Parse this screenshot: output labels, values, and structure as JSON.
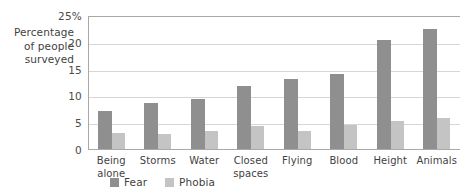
{
  "chart_data": {
    "type": "bar",
    "title": "",
    "xlabel": "",
    "ylabel": "Percentage of people surveyed",
    "ylabel_lines": [
      "Percentage",
      "of people",
      "surveyed"
    ],
    "categories": [
      "Being alone",
      "Storms",
      "Water",
      "Closed spaces",
      "Flying",
      "Blood",
      "Height",
      "Animals"
    ],
    "category_lines": [
      [
        "Being",
        "alone"
      ],
      [
        "Storms"
      ],
      [
        "Water"
      ],
      [
        "Closed",
        "spaces"
      ],
      [
        "Flying"
      ],
      [
        "Blood"
      ],
      [
        "Height"
      ],
      [
        "Animals"
      ]
    ],
    "series": [
      {
        "name": "Fear",
        "color": "#8f8f8f",
        "values": [
          7.3,
          8.7,
          9.5,
          12.0,
          13.3,
          14.1,
          20.5,
          22.5
        ]
      },
      {
        "name": "Phobia",
        "color": "#c4c4c4",
        "values": [
          3.1,
          3.0,
          3.5,
          4.5,
          3.5,
          4.7,
          5.5,
          6.0
        ]
      }
    ],
    "ylim": [
      0,
      25
    ],
    "yticks": [
      0,
      5,
      10,
      15,
      20,
      25
    ],
    "ytick_labels": [
      "0",
      "5",
      "10",
      "15",
      "20",
      "25%"
    ],
    "grid": true,
    "legend_position": "bottom-left",
    "legend_entries": [
      "Fear",
      "Phobia"
    ]
  }
}
